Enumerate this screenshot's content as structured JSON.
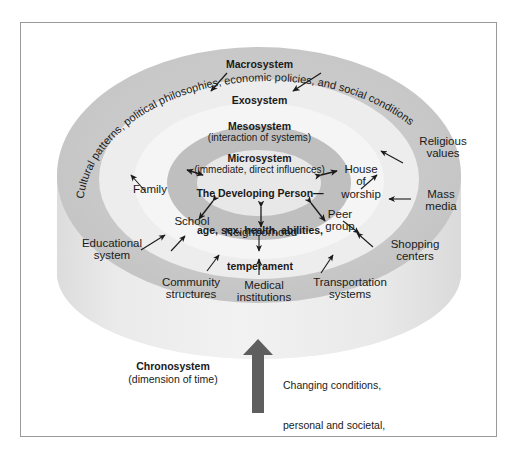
{
  "figure": {
    "type": "ecological-systems-model",
    "title_text": "",
    "rings": [
      {
        "name": "macrosystem",
        "label": "Macrosystem",
        "sublabel": "",
        "color": "#c9c9c9"
      },
      {
        "name": "exosystem",
        "label": "Exosystem",
        "sublabel": "",
        "color": "#ededed"
      },
      {
        "name": "mesosystem",
        "label": "Mesosystem",
        "sublabel": "(interaction of systems)",
        "color": "#f5f5f5"
      },
      {
        "name": "microsystem",
        "label": "Microsystem",
        "sublabel": "(immediate, direct influences)",
        "color": "#bfbfbf"
      },
      {
        "name": "core",
        "label": "",
        "sublabel": "",
        "color": "#e8e8e8"
      }
    ],
    "macrosystem_curved_text": "Cultural patterns, political philosophies, economic policies, and social conditions",
    "center": {
      "line1": "The Developing Person—",
      "line2": "age, sex, health, abilities,",
      "line3": "temperament"
    },
    "microsystem_nodes": [
      {
        "id": "family",
        "label": "Family"
      },
      {
        "id": "school",
        "label": "School"
      },
      {
        "id": "neighborhood",
        "label": "Neighborhood"
      },
      {
        "id": "peer-group",
        "label": "Peer\ngroup"
      },
      {
        "id": "house-of-worship",
        "label": "House\nof\nworship"
      }
    ],
    "exosystem_nodes": [
      {
        "id": "educational-system",
        "label": "Educational\nsystem"
      },
      {
        "id": "community-structures",
        "label": "Community\nstructures"
      },
      {
        "id": "medical-institutions",
        "label": "Medical\ninstitutions"
      },
      {
        "id": "transportation-systems",
        "label": "Transportation\nsystems"
      },
      {
        "id": "shopping-centers",
        "label": "Shopping\ncenters"
      },
      {
        "id": "mass-media",
        "label": "Mass\nmedia"
      },
      {
        "id": "religious-values",
        "label": "Religious\nvalues"
      }
    ],
    "chronosystem": {
      "title": "Chronosystem",
      "subtitle": "(dimension of time)",
      "caption_line1": "Changing conditions,",
      "caption_line2": "personal and societal,",
      "caption_line3": "over the life span",
      "arrow_color": "#5e5e5e"
    },
    "colors": {
      "border": "#9a9a9a",
      "text": "#1a1a1a",
      "arrow": "#1a1a1a",
      "cylinder_body": "#ebebeb"
    }
  }
}
